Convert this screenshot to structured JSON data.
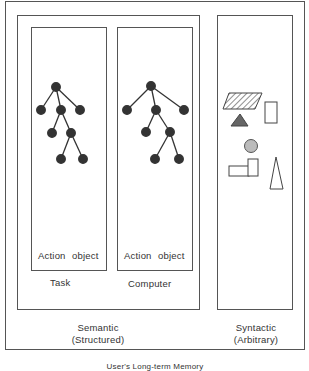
{
  "diagram": {
    "caption": "User's Long-term Memory",
    "semantic": {
      "title": "Semantic",
      "subtitle": "(Structured)",
      "panels": [
        {
          "name": "Task",
          "action_label": "Action",
          "object_label": "object"
        },
        {
          "name": "Computer",
          "action_label": "Action",
          "object_label": "object"
        }
      ]
    },
    "syntactic": {
      "title": "Syntactic",
      "subtitle": "(Arbitrary)",
      "shapes": [
        "hatched-parallelogram",
        "rectangle",
        "dark-triangle",
        "gray-circle",
        "rectangle-pair",
        "tall-triangle"
      ]
    },
    "colors": {
      "line": "#555555",
      "node": "#333333",
      "triangle_fill": "#666666",
      "circle_fill": "#bbbbbb"
    }
  }
}
